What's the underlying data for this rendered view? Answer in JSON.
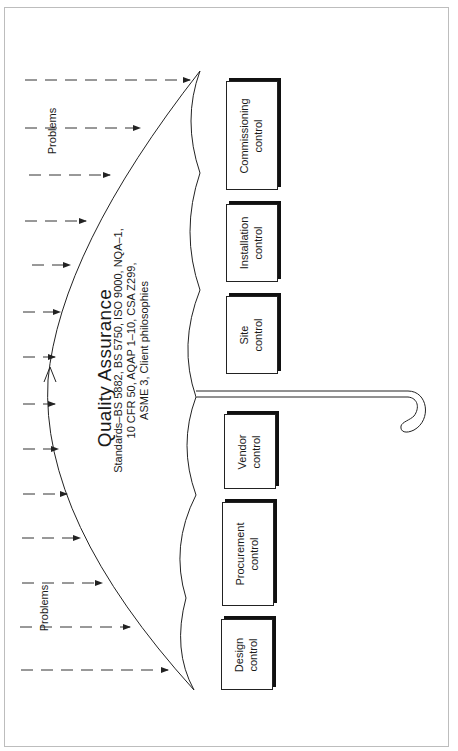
{
  "diagram": {
    "title": "Quality Assurance",
    "standards_lines": [
      "Standards–BS 5882, BS 5750, ISO 9000, NQA–1,",
      "10 CFR 50, AQAP 1–10, CSA Z299,",
      "ASME 3, Client philosophies"
    ],
    "problems_labels": [
      "Problems",
      "Problems"
    ],
    "controls": [
      {
        "line1": "Commissioning",
        "line2": "control"
      },
      {
        "line1": "Installation",
        "line2": "control"
      },
      {
        "line1": "Site",
        "line2": "control"
      },
      {
        "line1": "Vendor",
        "line2": "control"
      },
      {
        "line1": "Procurement",
        "line2": "control"
      },
      {
        "line1": "Design",
        "line2": "control"
      }
    ],
    "orientation": "rotated 90deg counter-clockwise",
    "colors": {
      "line": "#222222",
      "frame": "#bdbdbd",
      "background": "#ffffff"
    }
  }
}
